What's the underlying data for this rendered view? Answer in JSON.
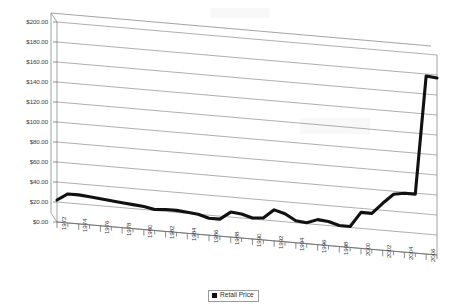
{
  "chart_data": {
    "type": "line",
    "title": "",
    "subtitle": "",
    "xlabel": "",
    "ylabel": "",
    "grid": true,
    "style_note": "3D perspective line chart, scanned document appearance",
    "legend": {
      "position": "bottom-center",
      "entries": [
        {
          "name": "Retail Price",
          "color": "#111111",
          "marker": "square"
        }
      ]
    },
    "ylim": [
      0,
      200
    ],
    "ytick_values": [
      0,
      20,
      40,
      60,
      80,
      100,
      120,
      140,
      160,
      180,
      200
    ],
    "ytick_labels": [
      "$0.00",
      "$20.00",
      "$40.00",
      "$60.00",
      "$80.00",
      "$100.00",
      "$120.00",
      "$140.00",
      "$160.00",
      "$180.00",
      "$200.00"
    ],
    "xlim": [
      1972,
      2007
    ],
    "xtick_labels": [
      "1972",
      "1974",
      "1976",
      "1978",
      "1980",
      "1982",
      "1984",
      "1986",
      "1988",
      "1990",
      "1992",
      "1994",
      "1996",
      "1998",
      "2000",
      "2002",
      "2004",
      "2006"
    ],
    "xtick_interval_years": 2,
    "minor_ticks_every_year": true,
    "x": [
      1972,
      1973,
      1974,
      1975,
      1976,
      1977,
      1978,
      1979,
      1980,
      1981,
      1982,
      1983,
      1984,
      1985,
      1986,
      1987,
      1988,
      1989,
      1990,
      1991,
      1992,
      1993,
      1994,
      1995,
      1996,
      1997,
      1998,
      1999,
      2000,
      2001,
      2002,
      2003,
      2004,
      2005,
      2006,
      2007
    ],
    "series": [
      {
        "name": "Retail Price",
        "color": "#111111",
        "values": [
          22,
          29,
          29,
          28,
          27,
          26,
          25,
          24,
          23,
          21,
          22,
          22,
          21,
          20,
          17,
          17,
          25,
          24,
          21,
          22,
          31,
          28,
          22,
          21,
          25,
          24,
          21,
          21,
          36,
          36,
          47,
          57,
          59,
          59,
          178,
          177
        ]
      }
    ]
  },
  "legend": {
    "retail_price_label": "Retail Price"
  }
}
